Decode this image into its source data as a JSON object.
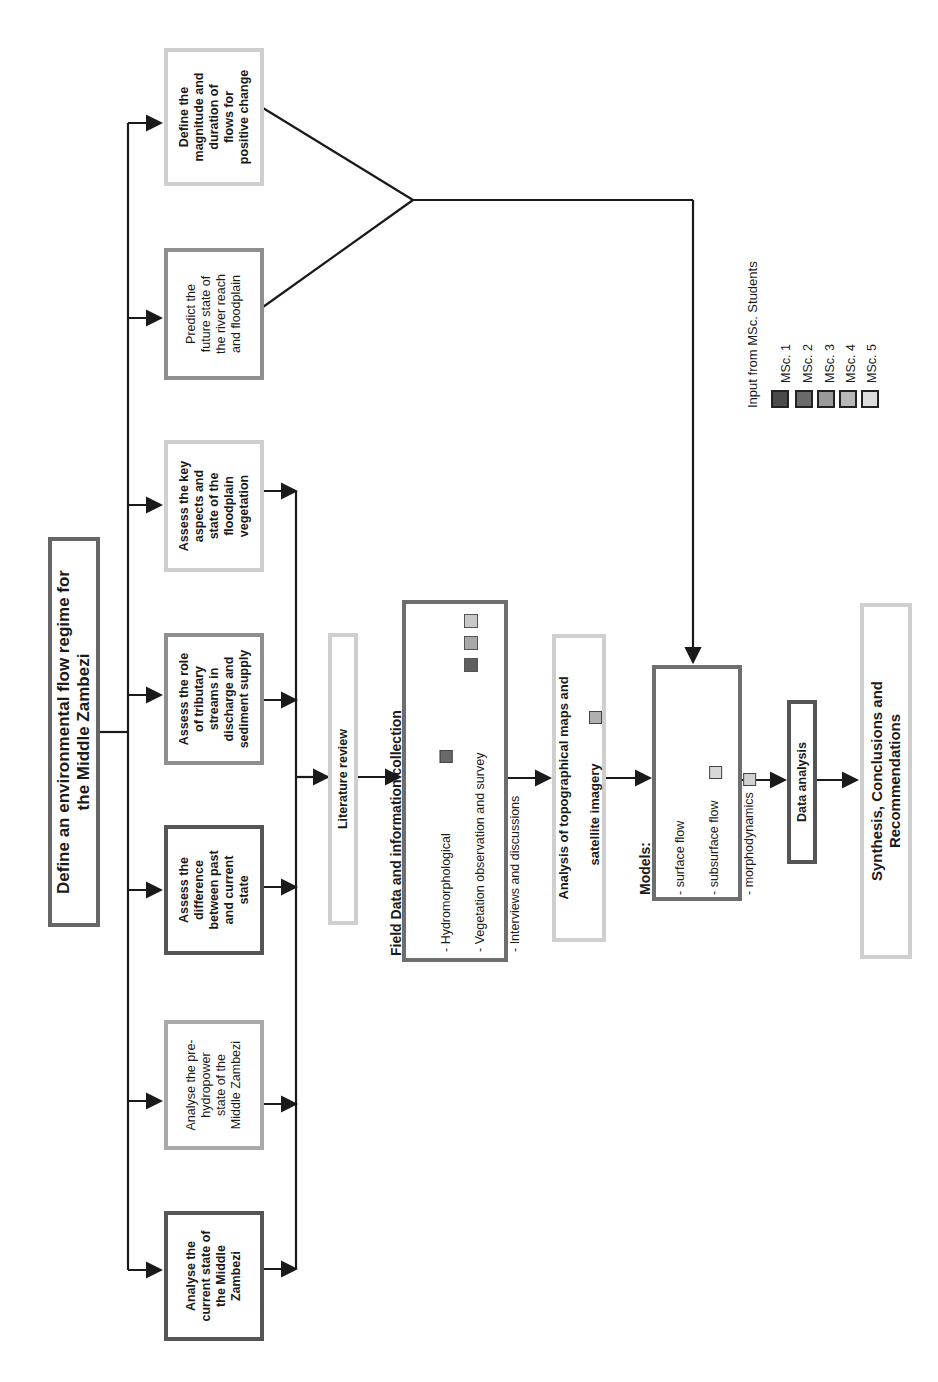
{
  "diagram": {
    "title": "Define an environmental flow regime for\nthe Middle Zambezi",
    "objectives": [
      {
        "id": "obj1",
        "text": "Analyse the\ncurrent state of\nthe Middle\nZambezi",
        "msc": 1
      },
      {
        "id": "obj2",
        "text": "Analyse the pre-\nhydropower\nstate of the\nMiddle Zambezi",
        "msc": 4
      },
      {
        "id": "obj3",
        "text": "Assess the\ndifference\nbetween past\nand current\nstate",
        "msc": 1
      },
      {
        "id": "obj4",
        "text": "Assess the role\nof tributary\nstreams in\ndischarge and\nsediment supply",
        "msc": 3
      },
      {
        "id": "obj5",
        "text": "Assess the key\naspects and\nstate of the\nfloodplain\nvegetation",
        "msc": 5
      },
      {
        "id": "obj6",
        "text": "Predict the\nfuture state of\nthe river reach\nand floodplain",
        "msc": 3
      },
      {
        "id": "obj7",
        "text": "Define the\nmagnitude and\nduration of\nflows for\npositive change",
        "msc": 5
      }
    ],
    "literature_review": "Literature review",
    "field_data": {
      "heading": "Field Data and information collection",
      "items": [
        {
          "text": "- Hydromorphological",
          "markers": [
            "#6a6a6a"
          ]
        },
        {
          "text": "- Vegetation observation and survey",
          "markers": []
        },
        {
          "text": "- Interviews and discussions",
          "markers": []
        }
      ],
      "right_markers": [
        "#c8c8c8",
        "#a8a8a8",
        "#5e5e5e"
      ]
    },
    "topo_analysis": {
      "line1": "Analysis of topographical maps and",
      "line2": "satellite imagery",
      "marker": "#b0b0b0"
    },
    "models": {
      "heading": "Models:",
      "items": [
        {
          "text": "- surface flow",
          "marker": ""
        },
        {
          "text": "- subsurface flow",
          "marker": "#d8d8d8"
        },
        {
          "text": "- morphodynamics",
          "marker": "#d0d0d0"
        }
      ]
    },
    "data_analysis": "Data analysis",
    "synthesis": "Synthesis, Conclusions and\nRecommendations",
    "legend": {
      "title": "Input from MSc. Students",
      "items": [
        {
          "label": "MSc. 1",
          "color": "#4a4a4a"
        },
        {
          "label": "MSc. 2",
          "color": "#6a6a6a"
        },
        {
          "label": "MSc. 3",
          "color": "#9a9a9a"
        },
        {
          "label": "MSc. 4",
          "color": "#b8b8b8"
        },
        {
          "label": "MSc. 5",
          "color": "#dcdcdc"
        }
      ]
    }
  }
}
